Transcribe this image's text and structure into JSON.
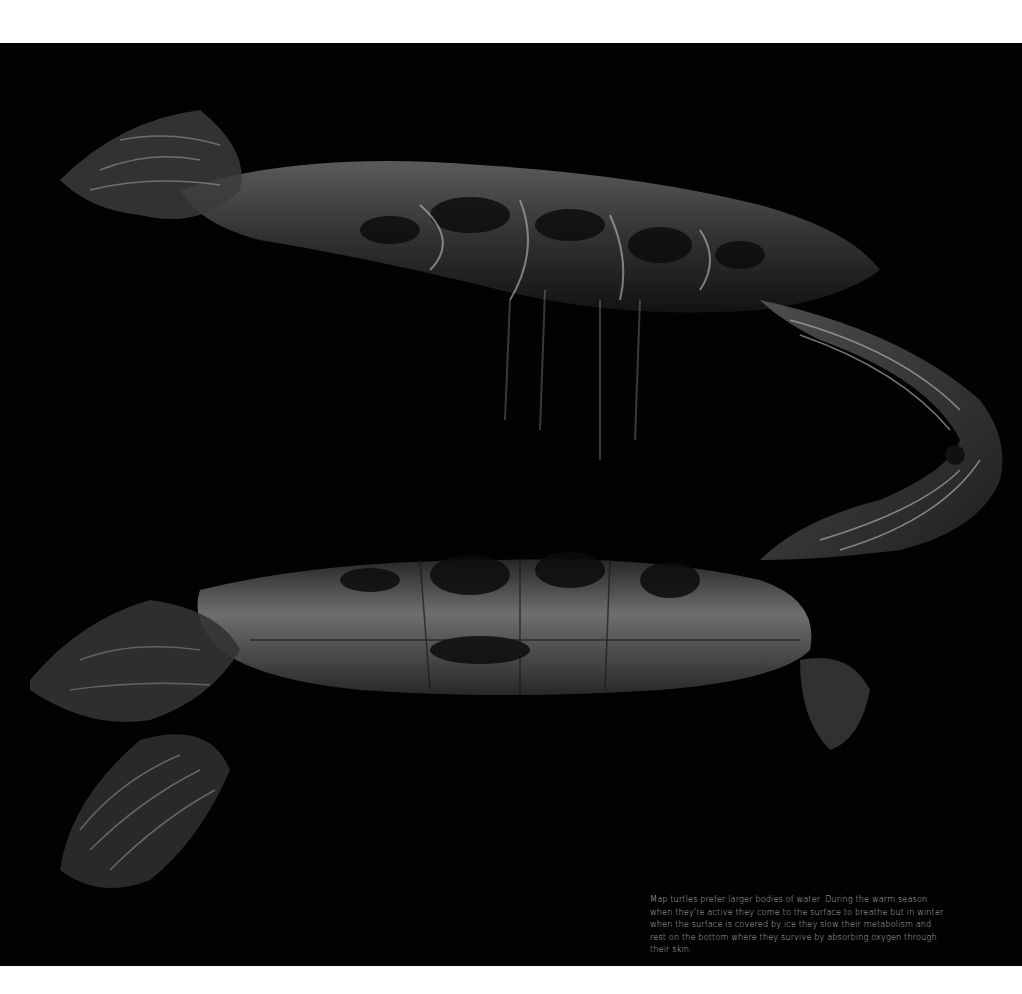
{
  "photo": {
    "subject": "map turtle reflected at water surface",
    "background_color": "#020202"
  },
  "caption": {
    "text": "Map turtles prefer larger bodies of water. During the warm season when they're active they come to the surface to breathe but in winter when the surface is covered by ice they slow their metabolism and rest on the bottom where they survive by absorbing oxygen through their skin."
  }
}
